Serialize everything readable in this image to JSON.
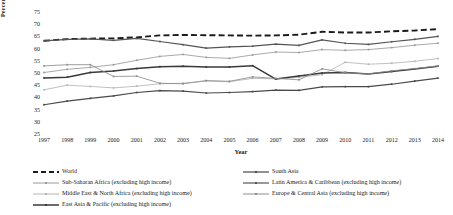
{
  "chart_data": {
    "type": "line",
    "title": "",
    "xlabel": "Year",
    "ylabel": "Percent (%)",
    "grid": false,
    "legend_position": "bottom",
    "xlim": [
      1997,
      2014
    ],
    "ylim": [
      25,
      75
    ],
    "ytick_step": 5,
    "yticks": [
      75,
      70,
      65,
      60,
      55,
      50,
      45,
      40,
      35,
      30,
      25
    ],
    "categories": [
      1997,
      1998,
      1999,
      2000,
      2001,
      2002,
      2003,
      2004,
      2005,
      2006,
      2007,
      2008,
      2009,
      2010,
      2011,
      2012,
      2013,
      2014
    ],
    "x": [
      "1997",
      "1998",
      "1999",
      "2000",
      "2001",
      "2002",
      "2003",
      "2004",
      "2005",
      "2006",
      "2007",
      "2008",
      "2009",
      "2010",
      "2011",
      "2012",
      "2013",
      "2014"
    ],
    "series": [
      {
        "name": "World",
        "style": "dashed",
        "color": "#1a1a1a",
        "width": 1.9,
        "marker": false,
        "values": [
          63.2,
          63.9,
          64.1,
          64.2,
          64.6,
          65.4,
          65.6,
          65.5,
          65.4,
          65.3,
          65.4,
          65.7,
          66.9,
          66.6,
          66.6,
          67.1,
          67.4,
          68.0
        ]
      },
      {
        "name": "Sub-Saharan Africa (excluding high income)",
        "style": "solid",
        "color": "#9a9a9a",
        "width": 0.85,
        "marker": true,
        "values": [
          50.2,
          51.5,
          52.3,
          53.4,
          55.2,
          56.8,
          57.6,
          56.4,
          56.0,
          57.4,
          58.6,
          58.4,
          59.6,
          59.3,
          59.6,
          60.4,
          61.4,
          62.2
        ]
      },
      {
        "name": "Middle East & North Africa (excluding high income)",
        "style": "solid",
        "color": "#b5b5b5",
        "width": 0.85,
        "marker": true,
        "values": [
          43.1,
          45.0,
          44.5,
          43.9,
          44.6,
          45.6,
          45.8,
          46.7,
          46.4,
          47.8,
          47.6,
          48.2,
          49.3,
          54.4,
          53.6,
          54.0,
          54.8,
          55.9
        ]
      },
      {
        "name": "East Asia & Pacific (excluding high income)",
        "style": "solid",
        "color": "#3a3a3a",
        "width": 1.5,
        "marker": true,
        "values": [
          48.0,
          48.3,
          50.2,
          50.8,
          51.8,
          52.6,
          52.8,
          52.5,
          52.5,
          53.0,
          47.5,
          48.8,
          50.0,
          50.2,
          49.6,
          50.6,
          51.6,
          52.8
        ]
      },
      {
        "name": "South Asia",
        "style": "solid",
        "color": "#4a4a4a",
        "width": 1.2,
        "marker": true,
        "values": [
          37.0,
          38.5,
          39.6,
          40.6,
          42.0,
          42.8,
          42.6,
          41.8,
          42.0,
          42.4,
          43.0,
          42.9,
          44.3,
          44.4,
          44.4,
          45.4,
          46.7,
          47.9
        ]
      },
      {
        "name": "Latin America & Caribbean (excluding high income)",
        "style": "solid",
        "color": "#555555",
        "width": 1.2,
        "marker": true,
        "values": [
          63.2,
          63.8,
          64.0,
          63.4,
          64.2,
          62.9,
          61.6,
          60.2,
          60.7,
          61.0,
          61.8,
          61.3,
          63.6,
          62.2,
          61.7,
          62.8,
          63.8,
          65.0
        ]
      },
      {
        "name": "Europe & Central Asia (excluding high income)",
        "style": "solid",
        "color": "#8d8d8d",
        "width": 0.85,
        "marker": true,
        "values": [
          52.9,
          53.4,
          53.4,
          48.6,
          48.7,
          45.8,
          45.6,
          46.9,
          46.6,
          48.4,
          47.8,
          47.2,
          51.7,
          50.1,
          49.6,
          50.9,
          51.8,
          52.9
        ]
      }
    ]
  },
  "legend": {
    "left_column": [
      {
        "label": "World",
        "key": "dashed-line-key"
      },
      {
        "label": "Sub-Saharan Africa (excluding high income)",
        "key": "solid-line-key"
      },
      {
        "label": "Middle East & North Africa (excluding high income)",
        "key": "solid-line-key"
      },
      {
        "label": "East Asia & Pacific (excluding high income)",
        "key": "solid-line-key"
      }
    ],
    "right_column": [
      {
        "label": "South Asia",
        "key": "solid-line-key"
      },
      {
        "label": "Latin America & Caribbean (excluding high income)",
        "key": "solid-line-key"
      },
      {
        "label": "Europe & Central Asia (excluding high income)",
        "key": "solid-line-key"
      }
    ]
  }
}
